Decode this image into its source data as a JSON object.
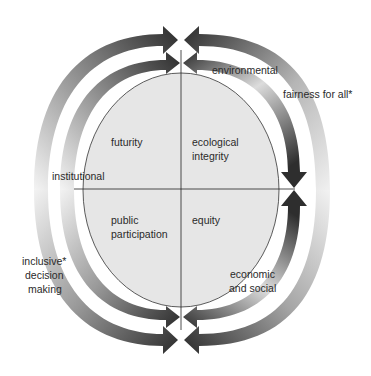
{
  "diagram": {
    "title": "",
    "quadrants": {
      "top_left": "futurity",
      "top_right_line1": "ecological",
      "top_right_line2": "integrity",
      "bottom_left_line1": "public",
      "bottom_left_line2": "participation",
      "bottom_right": "equity"
    },
    "axis_labels": {
      "left": "institutional",
      "top_right": "environmental",
      "bottom_right_line1": "economic",
      "bottom_right_line2": "and social"
    },
    "outer_labels": {
      "right": "fairness for all*",
      "left_line1": "inclusive*",
      "left_line2": "decision",
      "left_line3": "making"
    },
    "colors": {
      "ellipse_fill": "#e6e6e6",
      "arrow_dark": "#333333",
      "arrow_light": "#f2f2f2",
      "line": "#222222"
    }
  }
}
